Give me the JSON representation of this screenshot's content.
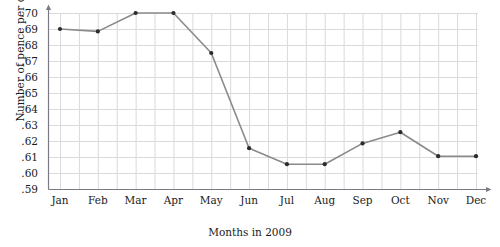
{
  "chart_data": {
    "type": "line",
    "title": "",
    "xlabel": "Months in 2009",
    "ylabel": "Number of pence per dollar",
    "categories": [
      "Jan",
      "Feb",
      "Mar",
      "Apr",
      "May",
      "Jun",
      "Jul",
      "Aug",
      "Sep",
      "Oct",
      "Nov",
      "Dec"
    ],
    "series": [
      {
        "name": "Pence per dollar",
        "values": [
          0.69,
          0.6885,
          0.7,
          0.7,
          0.675,
          0.6155,
          0.6055,
          0.6055,
          0.6185,
          0.6255,
          0.6105,
          0.6105
        ]
      }
    ],
    "ylim": [
      0.59,
      0.7
    ],
    "ytick_labels": [
      ".70",
      ".69",
      ".68",
      ".67",
      ".66",
      ".65",
      ".64",
      ".63",
      ".62",
      ".61",
      ".60",
      ".59"
    ],
    "ytick_values": [
      0.7,
      0.69,
      0.68,
      0.67,
      0.66,
      0.65,
      0.64,
      0.63,
      0.62,
      0.61,
      0.6,
      0.59
    ],
    "grid": true,
    "grid_color": "#d9d9de",
    "legend": "none",
    "line_color": "#8a8a8a",
    "marker_color": "#2b2b2b",
    "axis_color": "#7a7a84",
    "axis_arrows": true
  }
}
